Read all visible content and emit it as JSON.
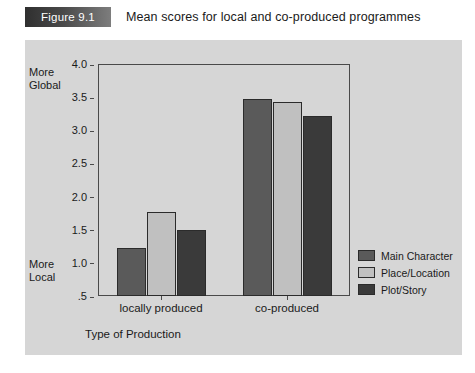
{
  "caption": {
    "tab_label": "Figure 9.1",
    "title": "Mean scores for local and co-produced programmes"
  },
  "axis_anchors": {
    "top_line1": "More",
    "top_line2": "Global",
    "bottom_line1": "More",
    "bottom_line2": "Local"
  },
  "chart_data": {
    "type": "bar",
    "title": "Mean scores for local and co-produced programmes",
    "xlabel": "Type of Production",
    "ylabel": "",
    "categories": [
      "locally produced",
      "co-produced"
    ],
    "series": [
      {
        "name": "Main Character",
        "values": [
          1.22,
          3.47
        ],
        "color": "#5a5a5a"
      },
      {
        "name": "Place/Location",
        "values": [
          1.76,
          3.43
        ],
        "color": "#c0c0c0"
      },
      {
        "name": "Plot/Story",
        "values": [
          1.5,
          3.22
        ],
        "color": "#3a3a3a"
      }
    ],
    "ylim": [
      0.5,
      4.0
    ],
    "yticks": [
      "4.0",
      "3.5",
      "3.0",
      "2.5",
      "2.0",
      "1.5",
      "1.0",
      ".5"
    ],
    "ytick_values": [
      4.0,
      3.5,
      3.0,
      2.5,
      2.0,
      1.5,
      1.0,
      0.5
    ],
    "grid": false,
    "legend_position": "right"
  }
}
